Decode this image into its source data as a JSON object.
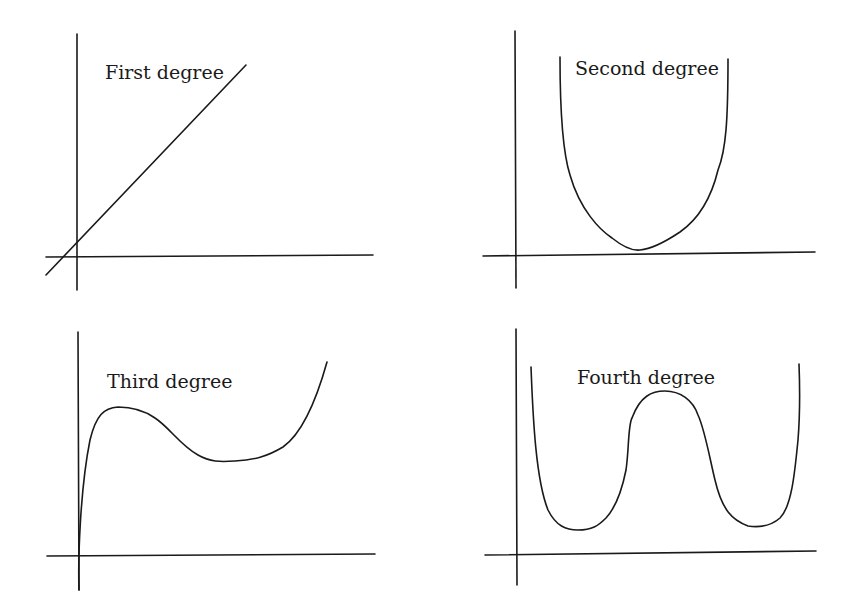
{
  "figure": {
    "panels": [
      {
        "id": "first",
        "label": "First degree",
        "shape": "straight line with positive slope crossing both axes near the origin",
        "axes": {
          "y": [
            77,
            34,
            77,
            290
          ],
          "x": [
            46,
            257,
            373,
            255
          ]
        },
        "curve": "M46,275 L246,65",
        "label_pos": [
          105,
          79
        ]
      },
      {
        "id": "second",
        "label": "Second degree",
        "shape": "U-shaped parabola with minimum touching just above x-axis",
        "axes": {
          "y": [
            515,
            31,
            516,
            288
          ],
          "x": [
            483,
            256,
            815,
            252
          ]
        },
        "curve": "M560,57 C560,110 562,150 570,175 C580,210 600,230 612,238 C622,246 632,251 640,250 C652,249 668,240 680,232 C700,218 712,195 718,170 C726,150 728,120 728,59",
        "label_pos": [
          575,
          75
        ]
      },
      {
        "id": "third",
        "label": "Third degree",
        "shape": "cubic rising steeply from origin to a local maximum, dipping to a local minimum, then rising",
        "axes": {
          "y": [
            78,
            332,
            79,
            590
          ],
          "x": [
            47,
            556,
            375,
            554
          ]
        },
        "curve": "M79,590 C78,560 80,490 90,440 C96,415 104,408 118,407 C132,407 145,411 155,418 C170,428 180,445 198,455 C210,462 220,462 235,461 C255,460 268,456 283,447 C300,435 315,405 327,362",
        "label_pos": [
          107,
          388
        ]
      },
      {
        "id": "fourth",
        "label": "Fourth degree",
        "shape": "W-shaped quartic with two local minima and a central local maximum",
        "axes": {
          "y": [
            516,
            329,
            517,
            585
          ],
          "x": [
            485,
            555,
            816,
            551
          ]
        },
        "curve": "M531,367 C533,420 536,480 548,510 C556,526 566,530 578,530 C592,530 598,526 606,518 C618,505 623,485 626,470 C629,450 628,425 632,418 C640,396 652,391 665,391 C680,391 693,400 698,415 C705,430 710,460 715,480 C722,510 732,520 748,526 C762,528 772,525 780,518 C792,506 795,470 798,440 C800,415 800,390 799,364",
        "label_pos": [
          577,
          384
        ]
      }
    ],
    "colors": {
      "stroke": "#1a1a1a",
      "background": "#ffffff"
    }
  }
}
